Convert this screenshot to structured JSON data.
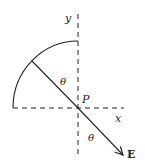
{
  "diagram": {
    "labels": {
      "y_axis": "y",
      "x_axis": "x",
      "point": "P",
      "angle_upper": "θ",
      "angle_lower": "θ",
      "vector": "E"
    },
    "colors": {
      "stroke": "#222222",
      "background": "#ffffff"
    }
  }
}
